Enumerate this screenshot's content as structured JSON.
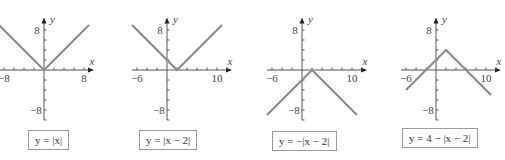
{
  "chart_data": [
    {
      "type": "line",
      "title": "y = |x|",
      "equation": "y = |x|",
      "xlabel": "x",
      "ylabel": "y",
      "x_tick_labels": [
        "-8",
        "8"
      ],
      "y_tick_labels": [
        "8",
        "-8"
      ],
      "xlim": [
        -9,
        10
      ],
      "ylim": [
        -10,
        10.5
      ],
      "x": [
        -9,
        0,
        9
      ],
      "y": [
        9,
        0,
        9
      ],
      "vertex": [
        0,
        0
      ],
      "grid": false,
      "line_color": "#8a8a8a"
    },
    {
      "type": "line",
      "title": "y = |x - 2|",
      "equation": "y = |x − 2|",
      "xlabel": "x",
      "ylabel": "y",
      "x_tick_labels": [
        "-6",
        "10"
      ],
      "y_tick_labels": [
        "8",
        "-8"
      ],
      "xlim": [
        -7,
        13
      ],
      "ylim": [
        -10,
        10.5
      ],
      "x": [
        -7,
        2,
        11
      ],
      "y": [
        9,
        0,
        9
      ],
      "vertex": [
        2,
        0
      ],
      "grid": false,
      "line_color": "#8a8a8a"
    },
    {
      "type": "line",
      "title": "y = -|x - 2|",
      "equation": "y = −|x − 2|",
      "xlabel": "x",
      "ylabel": "y",
      "x_tick_labels": [
        "-6",
        "10"
      ],
      "y_tick_labels": [
        "8",
        "-8"
      ],
      "xlim": [
        -7,
        13
      ],
      "ylim": [
        -10,
        10.5
      ],
      "x": [
        -7,
        2,
        11
      ],
      "y": [
        -9,
        0,
        -9
      ],
      "vertex": [
        2,
        0
      ],
      "grid": false,
      "line_color": "#8a8a8a"
    },
    {
      "type": "line",
      "title": "y = 4 - |x - 2|",
      "equation": "y = 4 − |x − 2|",
      "xlabel": "x",
      "ylabel": "y",
      "x_tick_labels": [
        "-6",
        "10"
      ],
      "y_tick_labels": [
        "8",
        "-8"
      ],
      "xlim": [
        -7,
        13
      ],
      "ylim": [
        -10,
        10.5
      ],
      "x": [
        -6,
        2,
        11
      ],
      "y": [
        -4,
        4,
        -5
      ],
      "vertex": [
        2,
        4
      ],
      "grid": false,
      "line_color": "#8a8a8a"
    }
  ],
  "labels": {
    "eq1": "y = |x|",
    "eq2": "y = |x − 2|",
    "eq3": "y = −|x − 2|",
    "eq4": "y = 4 − |x − 2|"
  }
}
